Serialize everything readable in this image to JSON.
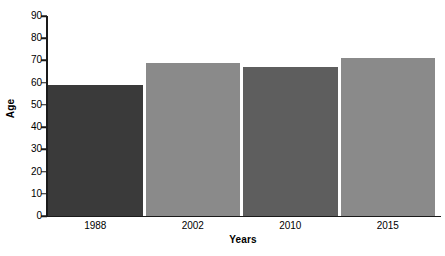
{
  "chart_data": {
    "type": "bar",
    "title": "",
    "categories": [
      "1988",
      "2002",
      "2010",
      "2015"
    ],
    "values": [
      59,
      69,
      67,
      71
    ],
    "xlabel": "Years",
    "ylabel": "Age",
    "ylim": [
      0,
      90
    ],
    "yticks": [
      0,
      10,
      20,
      30,
      40,
      50,
      60,
      70,
      80,
      90
    ],
    "ytick_labels": [
      "0",
      "10",
      "20",
      "30",
      "40",
      "50",
      "60",
      "70",
      "80",
      "90"
    ],
    "grid": false,
    "legend": false,
    "bar_colors": [
      "#3a3a3a",
      "#8a8a8a",
      "#5e5e5e",
      "#8a8a8a"
    ],
    "background_color": "#ffffff",
    "axis_color": "#1a1a1a"
  }
}
